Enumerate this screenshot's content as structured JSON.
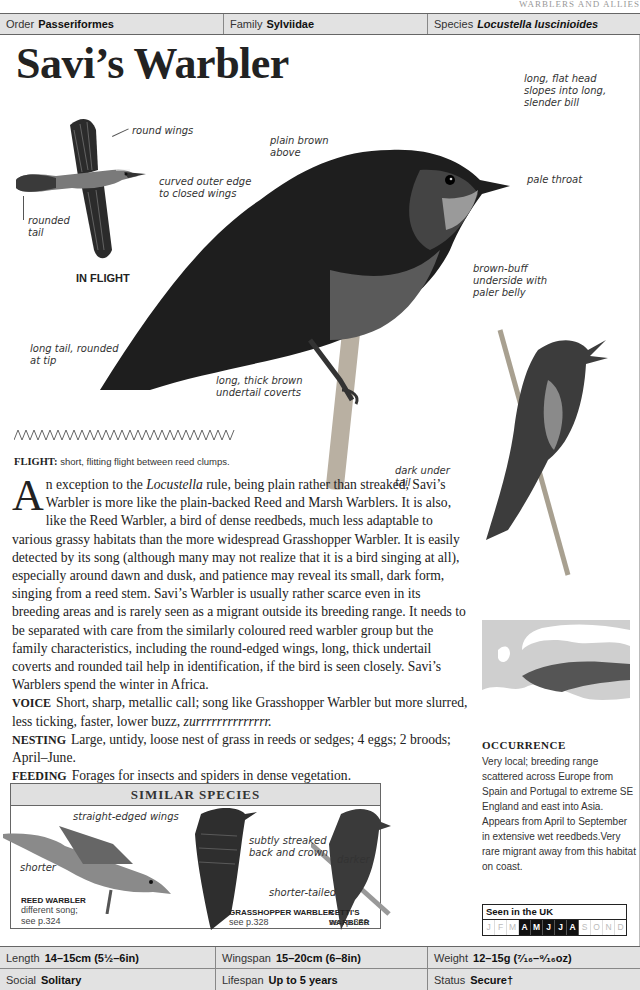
{
  "running_head": "WARBLERS AND ALLIES",
  "taxonomy": {
    "order_label": "Order",
    "order_value": "Passeriformes",
    "family_label": "Family",
    "family_value": "Sylviidae",
    "species_label": "Species",
    "species_value": "Locustella luscinioides"
  },
  "title": "Savi’s Warbler",
  "flight_illustration": {
    "caption": "IN FLIGHT",
    "labels": {
      "round_wings": "round wings",
      "rounded_tail_1": "rounded",
      "rounded_tail_2": "tail"
    }
  },
  "main_illustration": {
    "labels": {
      "curved_1": "curved outer edge",
      "curved_2": "to closed wings",
      "plain_1": "plain brown",
      "plain_2": "above",
      "head_1": "long, flat head",
      "head_2": "slopes into long,",
      "head_3": "slender bill",
      "throat": "pale throat",
      "under_1": "brown-buff",
      "under_2": "underside with",
      "under_3": "paler belly",
      "tail_1": "long tail, rounded",
      "tail_2": "at tip",
      "coverts_1": "long, thick brown",
      "coverts_2": "undertail coverts"
    }
  },
  "singing_illustration": {
    "labels": {
      "under_1": "dark under",
      "under_2": "tail"
    }
  },
  "flight": {
    "label": "FLIGHT:",
    "text": "short, flitting flight between reed clumps."
  },
  "description": {
    "dropcap": "A",
    "p1_a": "n exception to the ",
    "p1_italic": "Locustella",
    "p1_b": " rule, being plain rather than streaked, Savi’s Warbler is more like the plain-backed Reed and Marsh Warblers. It is also, like the Reed Warbler, a bird of dense reedbeds, much less adaptable to various grassy habitats than the more widespread Grasshopper Warbler. It is easily detected by its song (although many may not realize that it is a bird singing at all), especially around dawn and dusk, and patience may reveal its small, dark form, singing from a reed stem. Savi’s Warbler is usually rather scarce even in its breeding areas and is rarely seen as a migrant outside its breeding range. It needs to be separated with care from the similarly coloured reed warbler group but the family characteristics, including the round-edged wings, long, thick undertail coverts and rounded tail help in identification, if the bird is seen closely. Savi’s Warblers spend the winter in Africa.",
    "voice_label": "VOICE",
    "voice_text": "Short, sharp, metallic call; song like Grasshopper Warbler but more slurred, less ticking, faster, lower buzz, ",
    "voice_italic": "zurrrrrrrrrrrrrr.",
    "nesting_label": "NESTING",
    "nesting_text": "Large, untidy, loose nest of grass in reeds or sedges; 4 eggs; 2 broods; April–June.",
    "feeding_label": "FEEDING",
    "feeding_text": "Forages for insects and spiders in dense vegetation."
  },
  "similar_species": {
    "heading": "SIMILAR SPECIES",
    "species": [
      {
        "name": "REED WARBLER",
        "note_1": "different song;",
        "note_2": "see p.324"
      },
      {
        "name": "GRASSHOPPER WARBLER",
        "note_1": "see p.328"
      },
      {
        "name": "CETTI’S WARBLER",
        "note_1": "see p.330"
      }
    ],
    "labels": {
      "straight": "straight-edged wings",
      "shorter": "shorter",
      "streaked_1": "subtly streaked",
      "streaked_2": "back and crown",
      "shorter_tailed": "shorter-tailed",
      "darker": "darker"
    }
  },
  "occurrence": {
    "title": "OCCURRENCE",
    "text": "Very local; breeding range scattered across Europe from Spain and Portugal to extreme SE England and east into Asia. Appears from April to September in extensive wet reedbeds.Very rare migrant away from this habitat on coast."
  },
  "seen_in_uk": {
    "title": "Seen in the UK",
    "months": [
      {
        "m": "J",
        "on": false
      },
      {
        "m": "F",
        "on": false
      },
      {
        "m": "M",
        "on": false
      },
      {
        "m": "A",
        "on": true
      },
      {
        "m": "M",
        "on": true
      },
      {
        "m": "J",
        "on": true
      },
      {
        "m": "J",
        "on": true
      },
      {
        "m": "A",
        "on": true
      },
      {
        "m": "S",
        "on": false
      },
      {
        "m": "O",
        "on": false
      },
      {
        "m": "N",
        "on": false
      },
      {
        "m": "D",
        "on": false
      }
    ]
  },
  "stats": {
    "length_label": "Length",
    "length_value": "14–15cm (5½–6in)",
    "wingspan_label": "Wingspan",
    "wingspan_value": "15–20cm (6–8in)",
    "weight_label": "Weight",
    "weight_value": "12–15g (⁷⁄₁₆–⁹⁄₁₆oz)",
    "social_label": "Social",
    "social_value": "Solitary",
    "lifespan_label": "Lifespan",
    "lifespan_value": "Up to 5 years",
    "status_label": "Status",
    "status_value": "Secure†"
  },
  "colors": {
    "bar_bg": "#e2e2e2",
    "rule": "#666666",
    "month_on": "#111111",
    "month_off": "#bbbbbb"
  }
}
